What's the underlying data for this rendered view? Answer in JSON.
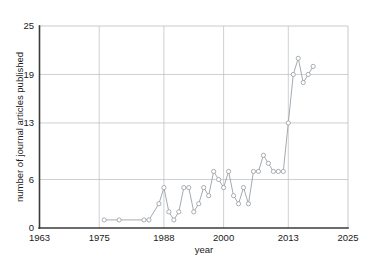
{
  "chart_data": {
    "type": "line",
    "title": "",
    "subtitle": "",
    "xlabel": "year",
    "ylabel": "number of journal articles published",
    "xlim": [
      1963,
      2025
    ],
    "ylim": [
      0,
      25
    ],
    "grid": true,
    "legend_position": "top-center",
    "legend_symbol": "line-with-open-circle-marker",
    "legend_entries": [
      ""
    ],
    "xticks": [
      1963,
      1975,
      1988,
      2000,
      2013,
      2025
    ],
    "xtick_labels": [
      "1963",
      "1975",
      "1988",
      "2000",
      "2013",
      "2025"
    ],
    "yticks": [
      0,
      6,
      13,
      19,
      25
    ],
    "ytick_labels": [
      "0",
      "6",
      "13",
      "19",
      "25"
    ],
    "x_gridlines": [
      1975,
      1988,
      2000,
      2013
    ],
    "y_gridlines": [
      6,
      13,
      19
    ],
    "series": [
      {
        "name": "journal articles published",
        "color": "#9aa0a6",
        "marker": "open-circle",
        "x": [
          1976,
          1979,
          1984,
          1985,
          1987,
          1988,
          1989,
          1990,
          1991,
          1992,
          1993,
          1994,
          1995,
          1996,
          1997,
          1998,
          1999,
          2000,
          2001,
          2002,
          2003,
          2004,
          2005,
          2006,
          2007,
          2008,
          2009,
          2010,
          2011,
          2012,
          2013,
          2014,
          2015,
          2016,
          2017,
          2018
        ],
        "y": [
          1,
          1,
          1,
          1,
          3,
          5,
          2,
          1,
          2,
          5,
          5,
          2,
          3,
          5,
          4,
          7,
          6,
          5,
          7,
          4,
          3,
          5,
          3,
          7,
          7,
          9,
          8,
          7,
          7,
          7,
          13,
          19,
          21,
          18,
          19,
          20
        ]
      }
    ],
    "data_points": [
      {
        "year": 1976,
        "count": 1
      },
      {
        "year": 1979,
        "count": 1
      },
      {
        "year": 1984,
        "count": 1
      },
      {
        "year": 1985,
        "count": 1
      },
      {
        "year": 1987,
        "count": 3
      },
      {
        "year": 1988,
        "count": 5
      },
      {
        "year": 1989,
        "count": 2
      },
      {
        "year": 1990,
        "count": 1
      },
      {
        "year": 1991,
        "count": 2
      },
      {
        "year": 1992,
        "count": 5
      },
      {
        "year": 1993,
        "count": 5
      },
      {
        "year": 1994,
        "count": 2
      },
      {
        "year": 1995,
        "count": 3
      },
      {
        "year": 1996,
        "count": 5
      },
      {
        "year": 1997,
        "count": 4
      },
      {
        "year": 1998,
        "count": 7
      },
      {
        "year": 1999,
        "count": 6
      },
      {
        "year": 2000,
        "count": 5
      },
      {
        "year": 2001,
        "count": 7
      },
      {
        "year": 2002,
        "count": 4
      },
      {
        "year": 2003,
        "count": 3
      },
      {
        "year": 2004,
        "count": 5
      },
      {
        "year": 2005,
        "count": 3
      },
      {
        "year": 2006,
        "count": 7
      },
      {
        "year": 2007,
        "count": 7
      },
      {
        "year": 2008,
        "count": 9
      },
      {
        "year": 2009,
        "count": 8
      },
      {
        "year": 2010,
        "count": 7
      },
      {
        "year": 2011,
        "count": 7
      },
      {
        "year": 2012,
        "count": 7
      },
      {
        "year": 2013,
        "count": 13
      },
      {
        "year": 2014,
        "count": 19
      },
      {
        "year": 2015,
        "count": 21
      },
      {
        "year": 2016,
        "count": 18
      },
      {
        "year": 2017,
        "count": 19
      },
      {
        "year": 2018,
        "count": 20
      }
    ]
  },
  "colors": {
    "series": "#9aa0a6",
    "grid": "#b9bcc0",
    "axis": "#3a3a3a",
    "text": "#1a1a1a",
    "background": "#ffffff"
  }
}
